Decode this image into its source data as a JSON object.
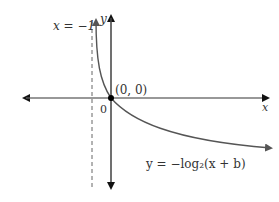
{
  "diagram": {
    "asymptote_label": "x = −1",
    "y_axis_label": "y",
    "x_axis_label": "x",
    "point_label": "(0, 0)",
    "origin_label": "0",
    "equation_label": "y = −log₂(x + b)",
    "colors": {
      "axis": "#111111",
      "curve": "#555555",
      "asymptote": "#666666",
      "point": "#000000"
    }
  }
}
